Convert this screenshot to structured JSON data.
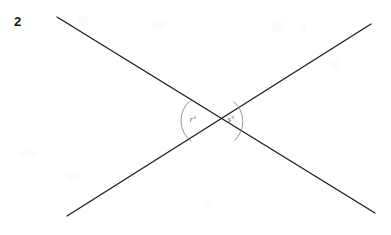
{
  "figure": {
    "problem_number": "2",
    "width": 391,
    "height": 235,
    "background_color": "#ffffff",
    "line_color": "#1b1b1b",
    "arc_color": "#8a8a8a",
    "label_color": "#4a4a4a",
    "number_color": "#111111",
    "intersection": {
      "x": 212,
      "y": 120
    },
    "lines": [
      {
        "name": "line-upper-left-to-lower-right",
        "x1": 57,
        "y1": 17,
        "x2": 375,
        "y2": 213
      },
      {
        "name": "line-lower-left-to-upper-right",
        "x1": 67,
        "y1": 216,
        "x2": 371,
        "y2": 24
      }
    ],
    "angles": [
      {
        "id": "angle-r",
        "variable": "r",
        "degree_symbol": "°",
        "label": "r°",
        "label_x": 193,
        "label_y": 122,
        "arc_path": "M 190.5 100.5 A 26 26 0 0 0 191.5 141.5",
        "position": "left"
      },
      {
        "id": "angle-s",
        "variable": "s",
        "degree_symbol": "°",
        "label": "s°",
        "label_x": 229,
        "label_y": 122,
        "arc_path": "M 233.5 101.5 A 26 26 0 0 1 234.5 140.5",
        "position": "right"
      }
    ]
  }
}
